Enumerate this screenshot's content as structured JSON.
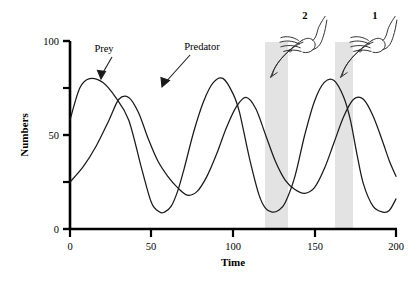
{
  "figure": {
    "background": "#ffffff",
    "ink_color": "#1a1a1a",
    "band_color": "#e3e3e3"
  },
  "chart_data": {
    "type": "line",
    "title": "",
    "xlabel": "Time",
    "ylabel": "Numbers",
    "xlim": [
      0,
      200
    ],
    "ylim": [
      0,
      100
    ],
    "grid": false,
    "legend": "inline-annotations",
    "xticks": [
      0,
      50,
      100,
      150,
      200
    ],
    "xtick_labels": [
      "0",
      "50",
      "100",
      "150",
      "200"
    ],
    "yticks": [
      0,
      25,
      50,
      75,
      100
    ],
    "ytick_labels": [
      "0",
      "",
      "50",
      "",
      "100"
    ],
    "ytick_major": [
      0,
      50,
      100
    ],
    "ytick_minor": [
      25,
      75
    ],
    "series": [
      {
        "name": "Prey",
        "label": "Prey",
        "color": "#1a1a1a",
        "description": "Oscillating prey population, peaks precede predator peaks",
        "period": 46,
        "peak_value": 80,
        "trough_value": 9,
        "start_value": 58,
        "x": [
          0,
          6,
          12,
          20,
          28,
          36,
          44,
          50,
          55,
          58,
          62,
          66,
          70,
          76,
          82,
          88,
          94,
          100,
          104,
          110,
          116,
          120,
          124,
          128,
          132,
          138,
          144,
          150,
          156,
          162,
          168,
          172,
          176,
          180,
          186,
          192,
          196,
          200
        ],
        "y": [
          58,
          75,
          80,
          78,
          70,
          58,
          32,
          14,
          9,
          9,
          12,
          20,
          32,
          52,
          68,
          78,
          80,
          72,
          62,
          38,
          18,
          11,
          9,
          10,
          14,
          28,
          50,
          68,
          78,
          79,
          70,
          58,
          40,
          24,
          12,
          9,
          10,
          16
        ]
      },
      {
        "name": "Predator",
        "label": "Predator",
        "color": "#1a1a1a",
        "description": "Oscillating predator population, lags prey by about 18 time units",
        "period": 46,
        "peak_value": 70,
        "trough_value": 18,
        "start_value": 25,
        "x": [
          0,
          8,
          16,
          24,
          30,
          36,
          42,
          48,
          54,
          60,
          66,
          72,
          78,
          84,
          90,
          96,
          102,
          108,
          114,
          120,
          126,
          132,
          138,
          144,
          150,
          156,
          162,
          168,
          174,
          180,
          186,
          192,
          196,
          200
        ],
        "y": [
          25,
          33,
          44,
          58,
          69,
          70,
          62,
          48,
          36,
          28,
          22,
          18,
          20,
          28,
          40,
          54,
          65,
          70,
          64,
          50,
          36,
          26,
          21,
          19,
          22,
          32,
          46,
          60,
          69,
          69,
          60,
          46,
          36,
          28
        ]
      }
    ],
    "annotations": [
      {
        "name": "prey-label",
        "text": "Prey",
        "x": 23,
        "y": 93,
        "arrow_to_x": 33,
        "arrow_to_y": 76
      },
      {
        "name": "predator-label",
        "text": "Predator",
        "x": 70,
        "y": 95,
        "arrow_to_x": 67,
        "arrow_to_y": 68
      }
    ],
    "highlight_bands": [
      {
        "name": "band-2",
        "marker": "2",
        "x_start": 120,
        "x_end": 134
      },
      {
        "name": "band-1",
        "marker": "1",
        "x_start": 163,
        "x_end": 174
      }
    ]
  },
  "markers": {
    "hand_icon_name": "pointing-hand-icon",
    "items": [
      {
        "number": "2"
      },
      {
        "number": "1"
      }
    ]
  }
}
